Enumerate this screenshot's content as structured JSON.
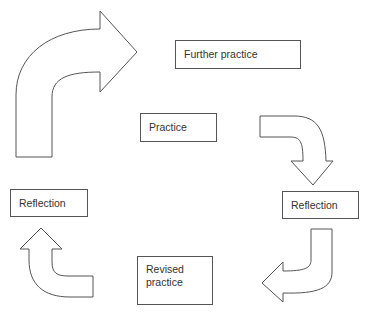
{
  "diagram": {
    "type": "cycle",
    "stroke_color": "#555555",
    "text_color": "#333333",
    "nodes": [
      {
        "id": "further_practice",
        "label": "Further practice"
      },
      {
        "id": "practice",
        "label": "Practice"
      },
      {
        "id": "reflection_right",
        "label": "Reflection"
      },
      {
        "id": "revised_practice",
        "label": "Revised practice",
        "lines": [
          "Revised",
          "practice"
        ]
      },
      {
        "id": "reflection_left",
        "label": "Reflection"
      }
    ],
    "edges": [
      {
        "from": "practice",
        "to": "reflection_right",
        "shape": "curved-arrow-down"
      },
      {
        "from": "reflection_right",
        "to": "revised_practice",
        "shape": "curved-arrow-left"
      },
      {
        "from": "revised_practice",
        "to": "reflection_left",
        "shape": "curved-arrow-up"
      },
      {
        "from": "reflection_left",
        "to": "further_practice",
        "shape": "large-curved-arrow-right"
      }
    ]
  }
}
